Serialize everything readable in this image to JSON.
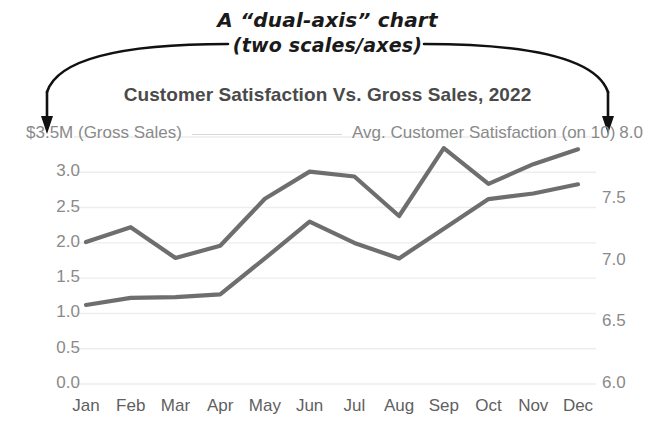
{
  "annotation": {
    "line1": "A “dual-axis” chart",
    "line2": "(two scales/axes)",
    "arrow_left_name": "curved arrow pointing to left axis",
    "arrow_right_name": "curved arrow pointing to right axis"
  },
  "chart_title": "Customer Satisfaction Vs. Gross Sales, 2022",
  "axis_captions": {
    "left": "$3.5M (Gross Sales)",
    "right_label": "Avg. Customer Satisfaction (on 10)",
    "right_value": "8.0"
  },
  "colors": {
    "line": "#6e6e6e",
    "grid": "#ededed",
    "tick_text": "#8a8a8a",
    "xtick_text": "#5f5f5f",
    "title_text": "#4a4a4a",
    "annotation_text": "#1a1a1a"
  },
  "chart_data": {
    "type": "line",
    "title": "Customer Satisfaction Vs. Gross Sales, 2022",
    "xlabel": "",
    "ylabel": "Gross Sales ($M)",
    "y2label": "Avg. Customer Satisfaction (on 10)",
    "grid": true,
    "legend": "none",
    "categories": [
      "Jan",
      "Feb",
      "Mar",
      "Apr",
      "May",
      "Jun",
      "Jul",
      "Aug",
      "Sep",
      "Oct",
      "Nov",
      "Dec"
    ],
    "ylim": [
      0.0,
      3.5
    ],
    "y2lim": [
      6.0,
      8.0
    ],
    "yticks": [
      "3.0",
      "2.5",
      "2.0",
      "1.5",
      "1.0",
      "0.5",
      "0.0"
    ],
    "yticks_top_label": "$3.5M",
    "y2ticks": [
      "8.0",
      "7.5",
      "7.0",
      "6.5",
      "6.0"
    ],
    "series": [
      {
        "name": "Avg. Customer Satisfaction (on 10)",
        "axis": "right",
        "values": [
          7.15,
          7.27,
          7.02,
          7.12,
          7.5,
          7.72,
          7.68,
          7.36,
          7.91,
          7.62,
          7.78,
          7.9
        ]
      },
      {
        "name": "Gross Sales ($M)",
        "axis": "left",
        "values": [
          1.12,
          1.22,
          1.23,
          1.27,
          1.78,
          2.3,
          2.0,
          1.78,
          2.2,
          2.62,
          2.7,
          2.83
        ]
      }
    ]
  }
}
